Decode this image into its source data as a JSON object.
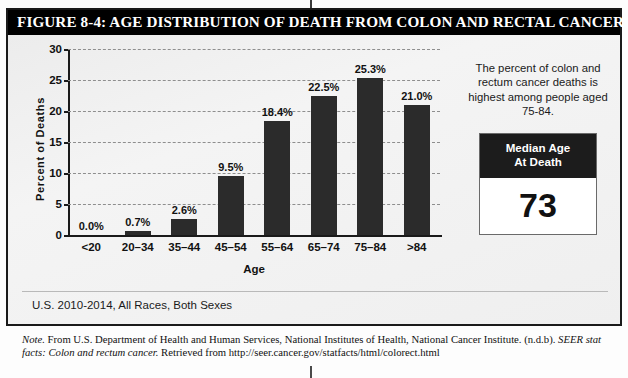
{
  "figure": {
    "title": "FIGURE 8-4: AGE DISTRIBUTION OF DEATH FROM COLON AND RECTAL CANCER",
    "subtitle": "U.S. 2010-2014, All Races, Both Sexes"
  },
  "callout": {
    "text": "The percent of colon and rectum cancer deaths is highest among people aged 75-84."
  },
  "median_box": {
    "header_line1": "Median Age",
    "header_line2": "At Death",
    "value": "73"
  },
  "note": {
    "label": "Note.",
    "body_1": " From U.S. Department of Health and Human Services, National Institutes of Health, National Cancer Institute. (n.d.b). ",
    "source_italic": "SEER stat facts: Colon and rectum cancer.",
    "body_2": " Retrieved from http://seer.cancer.gov/statfacts/html/colorect.html"
  },
  "colors": {
    "bar": "#2b2b2b",
    "title_bar": "#000000",
    "panel_bg": "#efefef",
    "gridline": "#8e8e8e"
  },
  "chart_data": {
    "type": "bar",
    "title": "AGE DISTRIBUTION OF DEATH FROM COLON AND RECTAL CANCER",
    "subtitle": "U.S. 2010-2014, All Races, Both Sexes",
    "xlabel": "Age",
    "ylabel": "Percent of Deaths",
    "categories": [
      "<20",
      "20–34",
      "35–44",
      "45–54",
      "55–64",
      "65–74",
      "75–84",
      ">84"
    ],
    "values": [
      0.0,
      0.7,
      2.6,
      9.5,
      18.4,
      22.5,
      25.3,
      21.0
    ],
    "data_labels": [
      "0.0%",
      "0.7%",
      "2.6%",
      "9.5%",
      "18.4%",
      "22.5%",
      "25.3%",
      "21.0%"
    ],
    "ylim": [
      0,
      30
    ],
    "yticks": [
      0,
      5,
      10,
      15,
      20,
      25,
      30
    ],
    "ytick_labels": [
      "0",
      "5",
      "10",
      "15",
      "20",
      "25",
      "30"
    ],
    "grid": true,
    "grid_style": "dashed",
    "legend": false,
    "series_color": "#2b2b2b"
  }
}
